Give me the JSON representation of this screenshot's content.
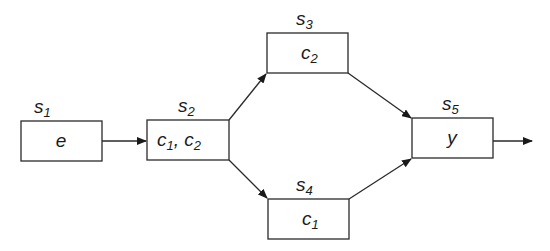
{
  "diagram": {
    "type": "flow",
    "nodes": [
      {
        "id": "s1",
        "state": "s",
        "sub": "1",
        "content": [
          {
            "t": "e",
            "s": ""
          }
        ]
      },
      {
        "id": "s2",
        "state": "s",
        "sub": "2",
        "content": [
          {
            "t": "c",
            "s": "1"
          },
          {
            "t": ", c",
            "s": "2"
          }
        ]
      },
      {
        "id": "s3",
        "state": "s",
        "sub": "3",
        "content": [
          {
            "t": "c",
            "s": "2"
          }
        ]
      },
      {
        "id": "s4",
        "state": "s",
        "sub": "4",
        "content": [
          {
            "t": "c",
            "s": "1"
          }
        ]
      },
      {
        "id": "s5",
        "state": "s",
        "sub": "5",
        "content": [
          {
            "t": "y",
            "s": ""
          }
        ]
      }
    ],
    "edges": [
      {
        "from": "s1",
        "to": "s2"
      },
      {
        "from": "s2",
        "to": "s3"
      },
      {
        "from": "s2",
        "to": "s4"
      },
      {
        "from": "s3",
        "to": "s5"
      },
      {
        "from": "s4",
        "to": "s5"
      },
      {
        "from": "s5",
        "to": "output"
      }
    ],
    "colors": {
      "stroke": "#2a2a2a",
      "text": "#1a1a1a",
      "background": "#ffffff"
    }
  }
}
